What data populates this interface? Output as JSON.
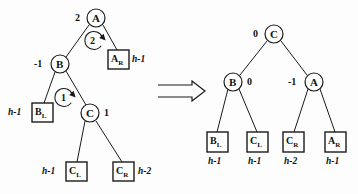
{
  "figure": {
    "kind": "avl-double-rotation-diagram",
    "transform_symbol": "⟹",
    "colors": {
      "stroke": "#1a1a1a",
      "background": "#fdfdfd",
      "text": "#111111"
    }
  },
  "left_tree": {
    "caption": "unbalanced tree before double rotation",
    "nodes": [
      {
        "id": "A",
        "label": "A",
        "balance": "2",
        "cx": 96,
        "cy": 18,
        "r": 9
      },
      {
        "id": "B",
        "label": "B",
        "balance": "-1",
        "cx": 60,
        "cy": 64,
        "r": 9
      },
      {
        "id": "C",
        "label": "C",
        "balance": "1",
        "cx": 90,
        "cy": 113,
        "r": 9
      }
    ],
    "boxes": [
      {
        "id": "AR",
        "label": "A",
        "sub": "R",
        "height": "h-1",
        "x": 108,
        "y": 50,
        "w": 21,
        "h": 19,
        "height_side": "right"
      },
      {
        "id": "BL",
        "label": "B",
        "sub": "L",
        "height": "h-1",
        "x": 32,
        "y": 103,
        "w": 21,
        "h": 19,
        "height_side": "left"
      },
      {
        "id": "CL",
        "label": "C",
        "sub": "L",
        "height": "h-1",
        "x": 66,
        "y": 162,
        "w": 21,
        "h": 19,
        "height_side": "left"
      },
      {
        "id": "CR",
        "label": "C",
        "sub": "R",
        "height": "h-2",
        "x": 113,
        "y": 162,
        "w": 21,
        "h": 19,
        "height_side": "right"
      }
    ],
    "edges": [
      {
        "from": "A",
        "to": "B"
      },
      {
        "from": "A",
        "to": "AR"
      },
      {
        "from": "B",
        "to": "BL"
      },
      {
        "from": "B",
        "to": "C"
      },
      {
        "from": "C",
        "to": "CL"
      },
      {
        "from": "C",
        "to": "CR"
      }
    ],
    "rotation_markers": [
      {
        "step": "2",
        "cx": 94,
        "cy": 41,
        "r": 9,
        "note": "second rotation at A"
      },
      {
        "step": "1",
        "cx": 64,
        "cy": 98,
        "r": 9,
        "note": "first rotation at B"
      }
    ]
  },
  "right_tree": {
    "caption": "balanced tree after double rotation",
    "nodes": [
      {
        "id": "C",
        "label": "C",
        "balance": "0",
        "cx": 274,
        "cy": 34,
        "r": 9
      },
      {
        "id": "B",
        "label": "B",
        "balance": "0",
        "cx": 233,
        "cy": 82,
        "r": 9
      },
      {
        "id": "A",
        "label": "A",
        "balance": "-1",
        "cx": 314,
        "cy": 82,
        "r": 9
      }
    ],
    "boxes": [
      {
        "id": "BL",
        "label": "B",
        "sub": "L",
        "height": "h-1",
        "x": 207,
        "y": 132,
        "w": 21,
        "h": 20
      },
      {
        "id": "CL",
        "label": "C",
        "sub": "L",
        "height": "h-1",
        "x": 247,
        "y": 132,
        "w": 21,
        "h": 20
      },
      {
        "id": "CR",
        "label": "C",
        "sub": "R",
        "height": "h-2",
        "x": 283,
        "y": 132,
        "w": 21,
        "h": 20
      },
      {
        "id": "AR",
        "label": "A",
        "sub": "R",
        "height": "h-1",
        "x": 325,
        "y": 132,
        "w": 21,
        "h": 20
      }
    ],
    "edges": [
      {
        "from": "C",
        "to": "B"
      },
      {
        "from": "C",
        "to": "A"
      },
      {
        "from": "B",
        "to": "BL"
      },
      {
        "from": "B",
        "to": "CL"
      },
      {
        "from": "A",
        "to": "CR"
      },
      {
        "from": "A",
        "to": "AR"
      }
    ]
  },
  "text_labels": {
    "left_A_balance": "2",
    "left_B_balance": "-1",
    "left_C_balance": "1",
    "left_step_two": "2",
    "left_step_one": "1",
    "left_AR_label": "A",
    "left_AR_sub": "R",
    "left_AR_height": "h-1",
    "left_BL_label": "B",
    "left_BL_sub": "L",
    "left_BL_height": "h-1",
    "left_CL_label": "C",
    "left_CL_sub": "L",
    "left_CL_height": "h-1",
    "left_CR_label": "C",
    "left_CR_sub": "R",
    "left_CR_height": "h-2",
    "left_node_A": "A",
    "left_node_B": "B",
    "left_node_C": "C",
    "right_node_C": "C",
    "right_node_B": "B",
    "right_node_A": "A",
    "right_C_balance": "0",
    "right_B_balance": "0",
    "right_A_balance": "-1",
    "right_BL_label": "B",
    "right_BL_sub": "L",
    "right_BL_height": "h-1",
    "right_CL_label": "C",
    "right_CL_sub": "L",
    "right_CL_height": "h-1",
    "right_CR_label": "C",
    "right_CR_sub": "R",
    "right_CR_height": "h-2",
    "right_AR_label": "A",
    "right_AR_sub": "R",
    "right_AR_height": "h-1"
  }
}
